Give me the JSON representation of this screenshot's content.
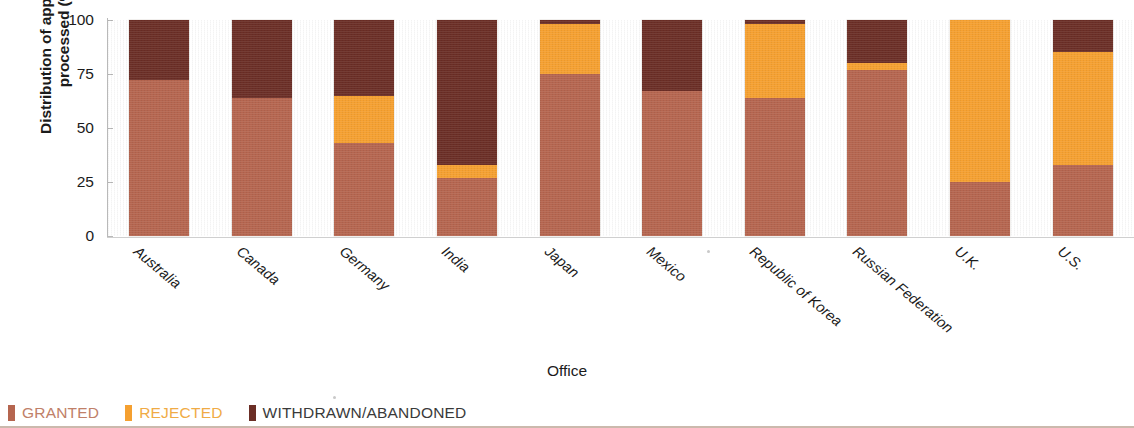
{
  "chart_data": {
    "type": "bar",
    "subtype": "stacked-100-percent",
    "title": "",
    "xlabel": "Office",
    "ylabel": "Distribution of applications\nprocessed (%)",
    "ylim": [
      0,
      100
    ],
    "yticks": [
      0,
      25,
      50,
      75,
      100
    ],
    "grid": false,
    "legend_position": "bottom-left",
    "categories": [
      "Australia",
      "Canada",
      "Germany",
      "India",
      "Japan",
      "Mexico",
      "Republic of Korea",
      "Russian Federation",
      "U.K.",
      "U.S."
    ],
    "series": [
      {
        "name": "GRANTED",
        "color": "#b5654f",
        "values": [
          72,
          64,
          43,
          27,
          75,
          67,
          64,
          77,
          25,
          33
        ]
      },
      {
        "name": "REJECTED",
        "color": "#f5a030",
        "values": [
          0,
          0,
          22,
          6,
          23,
          0,
          34,
          3,
          75,
          52
        ]
      },
      {
        "name": "WITHDRAWN/ABANDONED",
        "color": "#6b2e26",
        "values": [
          28,
          36,
          35,
          67,
          2,
          33,
          2,
          20,
          0,
          15
        ]
      }
    ]
  },
  "axis": {
    "y_title": "Distribution of applications\nprocessed (%)",
    "x_title": "Office",
    "tick_labels": [
      "100",
      "75",
      "50",
      "25",
      "0"
    ]
  },
  "legend": {
    "items": [
      {
        "label": "GRANTED",
        "color": "#b5654f"
      },
      {
        "label": "REJECTED",
        "color": "#f5a030"
      },
      {
        "label": "WITHDRAWN/ABANDONED",
        "color": "#6b2e26"
      }
    ]
  }
}
